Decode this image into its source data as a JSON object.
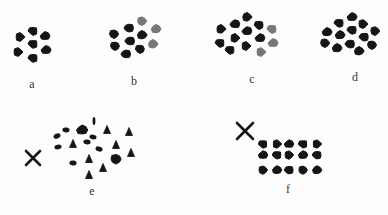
{
  "figure": {
    "colors": {
      "dark": "#151515",
      "grey": "#777777",
      "background": "#fdfdfd",
      "label": "#333333"
    },
    "panels": [
      {
        "id": "a",
        "label": "a",
        "label_pos": [
          32,
          84
        ],
        "dots": [
          {
            "x": 33,
            "y": 31,
            "c": "dark"
          },
          {
            "x": 20,
            "y": 37,
            "c": "dark"
          },
          {
            "x": 45,
            "y": 36,
            "c": "dark"
          },
          {
            "x": 33,
            "y": 44,
            "c": "dark"
          },
          {
            "x": 18,
            "y": 52,
            "c": "dark"
          },
          {
            "x": 46,
            "y": 50,
            "c": "dark"
          },
          {
            "x": 33,
            "y": 58,
            "c": "dark"
          }
        ]
      },
      {
        "id": "b",
        "label": "b",
        "label_pos": [
          134,
          81
        ],
        "dots": [
          {
            "x": 142,
            "y": 21,
            "c": "grey"
          },
          {
            "x": 156,
            "y": 29,
            "c": "grey"
          },
          {
            "x": 129,
            "y": 28,
            "c": "dark"
          },
          {
            "x": 114,
            "y": 34,
            "c": "dark"
          },
          {
            "x": 142,
            "y": 35,
            "c": "dark"
          },
          {
            "x": 130,
            "y": 41,
            "c": "dark"
          },
          {
            "x": 115,
            "y": 46,
            "c": "dark"
          },
          {
            "x": 153,
            "y": 44,
            "c": "grey"
          },
          {
            "x": 126,
            "y": 54,
            "c": "dark"
          },
          {
            "x": 140,
            "y": 49,
            "c": "dark"
          }
        ]
      },
      {
        "id": "c",
        "label": "c",
        "label_pos": [
          252,
          79
        ],
        "dots": [
          {
            "x": 247,
            "y": 17,
            "c": "dark"
          },
          {
            "x": 235,
            "y": 24,
            "c": "dark"
          },
          {
            "x": 259,
            "y": 25,
            "c": "dark"
          },
          {
            "x": 221,
            "y": 29,
            "c": "dark"
          },
          {
            "x": 247,
            "y": 31,
            "c": "dark"
          },
          {
            "x": 272,
            "y": 29,
            "c": "grey"
          },
          {
            "x": 235,
            "y": 38,
            "c": "dark"
          },
          {
            "x": 260,
            "y": 38,
            "c": "dark"
          },
          {
            "x": 220,
            "y": 43,
            "c": "dark"
          },
          {
            "x": 246,
            "y": 46,
            "c": "dark"
          },
          {
            "x": 273,
            "y": 43,
            "c": "grey"
          },
          {
            "x": 230,
            "y": 50,
            "c": "dark"
          },
          {
            "x": 261,
            "y": 52,
            "c": "grey"
          }
        ]
      },
      {
        "id": "d",
        "label": "d",
        "label_pos": [
          355,
          77
        ],
        "dots": [
          {
            "x": 352,
            "y": 17,
            "c": "dark"
          },
          {
            "x": 339,
            "y": 23,
            "c": "dark"
          },
          {
            "x": 363,
            "y": 24,
            "c": "dark"
          },
          {
            "x": 327,
            "y": 32,
            "c": "dark"
          },
          {
            "x": 352,
            "y": 30,
            "c": "dark"
          },
          {
            "x": 375,
            "y": 31,
            "c": "dark"
          },
          {
            "x": 340,
            "y": 35,
            "c": "dark"
          },
          {
            "x": 364,
            "y": 37,
            "c": "dark"
          },
          {
            "x": 325,
            "y": 43,
            "c": "dark"
          },
          {
            "x": 337,
            "y": 48,
            "c": "dark"
          },
          {
            "x": 350,
            "y": 44,
            "c": "dark"
          },
          {
            "x": 372,
            "y": 45,
            "c": "dark"
          },
          {
            "x": 359,
            "y": 51,
            "c": "dark"
          }
        ]
      },
      {
        "id": "e",
        "label": "e",
        "label_pos": [
          92,
          191
        ],
        "marker": {
          "type": "x",
          "x": 33,
          "y": 158,
          "size": 7
        },
        "shapes": [
          {
            "x": 94,
            "y": 121,
            "s": "sliver"
          },
          {
            "x": 66,
            "y": 130,
            "s": "blob"
          },
          {
            "x": 82,
            "y": 130,
            "s": "big"
          },
          {
            "x": 107,
            "y": 130,
            "s": "tri"
          },
          {
            "x": 129,
            "y": 132,
            "s": "tri"
          },
          {
            "x": 57,
            "y": 136,
            "s": "blob"
          },
          {
            "x": 93,
            "y": 137,
            "s": "blob"
          },
          {
            "x": 58,
            "y": 147,
            "s": "blob"
          },
          {
            "x": 73,
            "y": 144,
            "s": "tri"
          },
          {
            "x": 87,
            "y": 142,
            "s": "blob"
          },
          {
            "x": 116,
            "y": 145,
            "s": "tri"
          },
          {
            "x": 99,
            "y": 149,
            "s": "blob"
          },
          {
            "x": 131,
            "y": 153,
            "s": "tri"
          },
          {
            "x": 116,
            "y": 159,
            "s": "big"
          },
          {
            "x": 73,
            "y": 163,
            "s": "blob"
          },
          {
            "x": 89,
            "y": 159,
            "s": "tri"
          },
          {
            "x": 103,
            "y": 168,
            "s": "tri"
          },
          {
            "x": 89,
            "y": 175,
            "s": "tri"
          }
        ]
      },
      {
        "id": "f",
        "label": "f",
        "label_pos": [
          288,
          189
        ],
        "marker": {
          "type": "x",
          "x": 245,
          "y": 131,
          "size": 8
        },
        "grid": {
          "cols": [
            263,
            277,
            289,
            303,
            317
          ],
          "rows": [
            144,
            155,
            170
          ]
        }
      }
    ]
  }
}
